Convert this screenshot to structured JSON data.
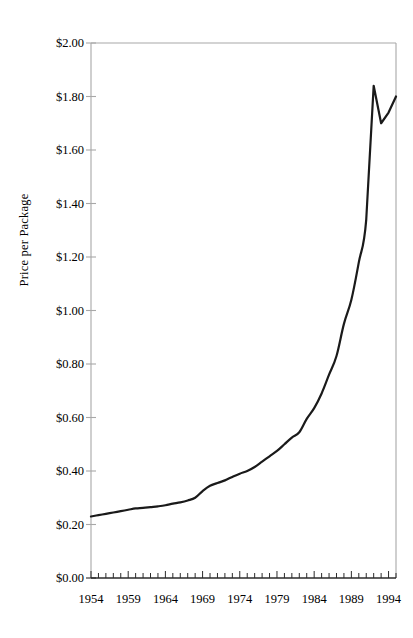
{
  "chart_data": {
    "type": "line",
    "title": "",
    "xlabel": "",
    "ylabel": "Price per Package",
    "xlim": [
      1954,
      1995
    ],
    "ylim": [
      0.0,
      2.0
    ],
    "grid": false,
    "legend": null,
    "y_tick_labels": [
      "$2.00",
      "$1.80",
      "$1.60",
      "$1.40",
      "$1.20",
      "$1.00",
      "$0.80",
      "$0.60",
      "$0.40",
      "$0.20",
      "$0.00"
    ],
    "y_tick_values": [
      2.0,
      1.8,
      1.6,
      1.4,
      1.2,
      1.0,
      0.8,
      0.6,
      0.4,
      0.2,
      0.0
    ],
    "x_tick_labels": [
      "1954",
      "1959",
      "1964",
      "1969",
      "1974",
      "1979",
      "1984",
      "1989",
      "1994"
    ],
    "x_tick_values": [
      1954,
      1959,
      1964,
      1969,
      1974,
      1979,
      1984,
      1989,
      1994
    ],
    "x_minor_tick_interval": 1,
    "line_color": "#1a1a1a",
    "line_width": 2.2,
    "axis_color": "#a8a8a8",
    "series": [
      {
        "name": "Price per Package",
        "x": [
          1954,
          1955,
          1956,
          1957,
          1958,
          1959,
          1960,
          1961,
          1962,
          1963,
          1964,
          1965,
          1966,
          1967,
          1968,
          1969,
          1970,
          1971,
          1972,
          1973,
          1974,
          1975,
          1976,
          1977,
          1978,
          1979,
          1980,
          1981,
          1982,
          1983,
          1984,
          1985,
          1986,
          1987,
          1988,
          1989,
          1990,
          1991,
          1992,
          1993,
          1994,
          1995
        ],
        "values": [
          0.23,
          0.235,
          0.24,
          0.245,
          0.25,
          0.255,
          0.26,
          0.262,
          0.265,
          0.268,
          0.272,
          0.278,
          0.283,
          0.29,
          0.3,
          0.325,
          0.345,
          0.355,
          0.365,
          0.378,
          0.39,
          0.4,
          0.415,
          0.435,
          0.455,
          0.475,
          0.5,
          0.525,
          0.545,
          0.595,
          0.635,
          0.69,
          0.76,
          0.83,
          0.95,
          1.04,
          1.18,
          1.34,
          1.5,
          1.63,
          1.74,
          1.8
        ],
        "peak": {
          "x": 1992,
          "y": 1.84
        },
        "dip": {
          "x": 1993,
          "y": 1.7
        },
        "end": {
          "x": 1995,
          "y": 1.8
        }
      }
    ]
  }
}
